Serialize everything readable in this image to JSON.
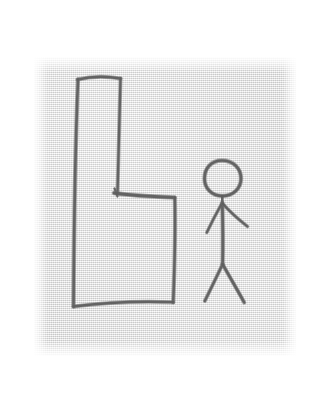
{
  "image": {
    "title": "Pencil sketch of a chair and a stick figure",
    "medium": "pencil on textured paper (scanned)",
    "canvas_width": 320,
    "canvas_height": 403,
    "background_color": "#ffffff",
    "paper_color": "#e6e6e6",
    "ink_color": "#5d5d5d"
  },
  "paper": {
    "label": "scanned paper sheet",
    "left": 34,
    "top": 57,
    "width": 262,
    "height": 299
  },
  "subjects": {
    "chair": {
      "label": "chair drawn in profile as an L shape",
      "description": "tall narrow backrest on the left with a seat extending to the right",
      "strokes": {
        "back_top": "M77.5,79.5 C90,76.5 106,76 120.5,78.5",
        "back_left": "M78,79.5 C75.5,140 74,225 73.5,306.5",
        "back_right": "M120.5,78.5 C119.5,120 118.5,160 117.5,192.5",
        "seat_top": "M114,193 C130,195.5 152,196.5 174.5,197.5",
        "seat_right": "M174.8,197.5 C175.5,230 174.5,270 173.2,302.5",
        "base_bottom": "M73.5,306.5 C100,303 140,301 173.2,302.2",
        "back_notch": "M114.5,188.5 L117.5,196.5"
      }
    },
    "stick_figure": {
      "label": "stick figure standing to the right of the chair",
      "description": "oval head, vertical torso, two outstretched arms and two legs",
      "strokes": {
        "head": "M222,160.5 C233.5,160.5 241,168.5 241,178.5 C241,188.5 233,196 222.5,196 C212,196 204.5,188.5 204.5,178.5 C204.5,168.5 211,160.5 222,160.5 Z",
        "neck": "M222.3,196 L222.3,203",
        "torso": "M222.3,202.5 C222.8,222 223,244 222.6,264.5",
        "arm_left": "M221.8,203.5 C216.5,213 211.5,222.5 206.8,232.5",
        "arm_right": "M222.6,203.5 C229.5,211.5 238,219 247.5,226.5",
        "leg_left": "M222.6,264.2 C216.5,277 210.5,289.5 204.8,301",
        "leg_right": "M222.6,264.2 C230,277.5 237.5,290 244.2,302.5"
      }
    }
  },
  "accessibility": {
    "alt_text": "A rough pencil drawing on gray textured paper showing a chair seen from the side as a large L shape, with a small stick figure person standing beside it on the right."
  }
}
